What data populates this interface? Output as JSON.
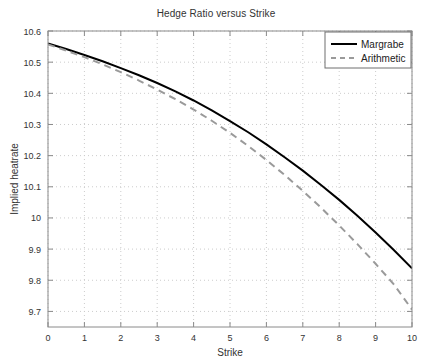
{
  "chart_data": {
    "type": "line",
    "title": "Hedge Ratio versus Strike",
    "xlabel": "Strike",
    "ylabel": "Implied heatrate",
    "xlim": [
      0,
      10
    ],
    "ylim": [
      9.65,
      10.6
    ],
    "grid": true,
    "legend_position": "top-right",
    "xticks": [
      "0",
      "1",
      "2",
      "3",
      "4",
      "5",
      "6",
      "7",
      "8",
      "9",
      "10"
    ],
    "yticks": [
      "10.6",
      "10.5",
      "10.4",
      "10.3",
      "10.2",
      "10.1",
      "10",
      "9.9",
      "9.8",
      "9.7"
    ],
    "x": [
      0,
      0.5,
      1,
      1.5,
      2,
      2.5,
      3,
      3.5,
      4,
      4.5,
      5,
      5.5,
      6,
      6.5,
      7,
      7.5,
      8,
      8.5,
      9,
      9.5,
      10
    ],
    "series": [
      {
        "name": "Margrabe",
        "color": "#000000",
        "style": "solid",
        "values": [
          10.56,
          10.542,
          10.523,
          10.503,
          10.481,
          10.458,
          10.433,
          10.406,
          10.377,
          10.345,
          10.311,
          10.275,
          10.236,
          10.195,
          10.152,
          10.106,
          10.058,
          10.007,
          9.953,
          9.897,
          9.838
        ]
      },
      {
        "name": "Arithmetic",
        "color": "#9a9a9a",
        "style": "dashed",
        "values": [
          10.557,
          10.537,
          10.516,
          10.493,
          10.468,
          10.441,
          10.412,
          10.381,
          10.348,
          10.312,
          10.273,
          10.231,
          10.186,
          10.138,
          10.087,
          10.033,
          9.976,
          9.916,
          9.853,
          9.787,
          9.706
        ]
      }
    ]
  },
  "legend": {
    "entries": [
      {
        "label": "Margrabe"
      },
      {
        "label": "Arithmetic"
      }
    ]
  },
  "axes": {
    "x_title": "Strike",
    "y_title": "Implied heatrate"
  }
}
